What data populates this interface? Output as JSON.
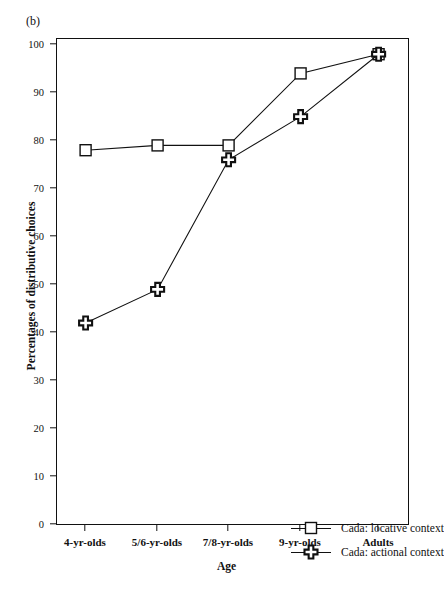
{
  "panel": {
    "label": "(b)"
  },
  "legend": {
    "position": "inside-bottom-right",
    "entries": [
      {
        "label": "Cada: locative context",
        "marker": "open-square-marker"
      },
      {
        "label": "Cada: actional context",
        "marker": "filled-cross-marker"
      }
    ]
  },
  "axes": {
    "x_title": "Age",
    "y_title": "Percentages of distributive choices",
    "y_ticks": [
      0,
      10,
      20,
      30,
      40,
      50,
      60,
      70,
      80,
      90,
      100
    ],
    "x_ticks": [
      "4-yr-olds",
      "5/6-yr-olds",
      "7/8-yr-olds",
      "9-yr-olds",
      "Adults"
    ]
  },
  "colors": {
    "line": "#111111",
    "marker_fill": "#ffffff",
    "frame": "#111111",
    "background": "#ffffff"
  },
  "chart_data": {
    "type": "line",
    "title": "",
    "xlabel": "Age",
    "ylabel": "Percentages of distributive choices",
    "categories": [
      "4-yr-olds",
      "5/6-yr-olds",
      "7/8-yr-olds",
      "9-yr-olds",
      "Adults"
    ],
    "ylim": [
      0,
      100
    ],
    "ytick_step": 10,
    "grid": false,
    "legend_position": "lower right inside axes",
    "series": [
      {
        "name": "Cada: locative context",
        "marker": "open-square",
        "values": [
          78,
          79,
          79,
          94,
          98
        ]
      },
      {
        "name": "Cada: actional context",
        "marker": "cross",
        "values": [
          42,
          49,
          76,
          85,
          98
        ]
      }
    ]
  }
}
